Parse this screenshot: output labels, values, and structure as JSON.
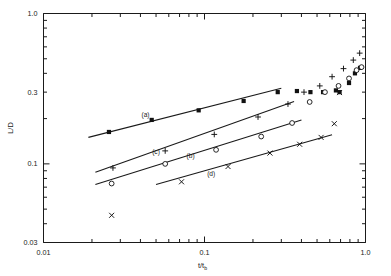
{
  "chart_data": {
    "type": "scatter",
    "title": "",
    "xlabel": "t/t_b",
    "ylabel": "L/D",
    "xscale": "log",
    "yscale": "log",
    "xlim": [
      0.01,
      1.0
    ],
    "ylim": [
      0.03,
      1.0
    ],
    "grid": false,
    "legend": "none",
    "xtick_labels": [
      "0.01",
      "0.1",
      "1.0"
    ],
    "xtick_values": [
      0.01,
      0.1,
      1.0
    ],
    "ytick_labels": [
      "0.03",
      "0.1",
      "0.3",
      "1.0"
    ],
    "ytick_values": [
      0.03,
      0.1,
      0.3,
      1.0
    ],
    "annotations": [
      {
        "text": "(a)",
        "x": 0.043,
        "y": 0.206
      },
      {
        "text": "(b)",
        "x": 0.082,
        "y": 0.11
      },
      {
        "text": "(c)",
        "x": 0.05,
        "y": 0.117
      },
      {
        "text": "(d)",
        "x": 0.11,
        "y": 0.083
      }
    ],
    "series": [
      {
        "name": "(a)",
        "marker": "filled-square",
        "fit_line": {
          "x": [
            0.019,
            0.3
          ],
          "y": [
            0.15,
            0.318
          ]
        },
        "points": [
          {
            "x": 0.0255,
            "y": 0.163
          },
          {
            "x": 0.047,
            "y": 0.196
          },
          {
            "x": 0.092,
            "y": 0.227
          },
          {
            "x": 0.175,
            "y": 0.262
          },
          {
            "x": 0.285,
            "y": 0.3
          },
          {
            "x": 0.375,
            "y": 0.305
          },
          {
            "x": 0.455,
            "y": 0.3
          },
          {
            "x": 0.545,
            "y": 0.3
          },
          {
            "x": 0.655,
            "y": 0.308
          },
          {
            "x": 0.69,
            "y": 0.3
          },
          {
            "x": 0.79,
            "y": 0.345
          },
          {
            "x": 0.86,
            "y": 0.4
          },
          {
            "x": 0.925,
            "y": 0.435
          }
        ]
      },
      {
        "name": "(c)",
        "marker": "plus",
        "fit_line": {
          "x": [
            0.021,
            0.36
          ],
          "y": [
            0.088,
            0.26
          ]
        },
        "points": [
          {
            "x": 0.027,
            "y": 0.094
          },
          {
            "x": 0.057,
            "y": 0.122
          },
          {
            "x": 0.115,
            "y": 0.157
          },
          {
            "x": 0.215,
            "y": 0.205
          },
          {
            "x": 0.33,
            "y": 0.25
          },
          {
            "x": 0.415,
            "y": 0.3
          },
          {
            "x": 0.52,
            "y": 0.33
          },
          {
            "x": 0.62,
            "y": 0.38
          },
          {
            "x": 0.73,
            "y": 0.43
          },
          {
            "x": 0.84,
            "y": 0.49
          },
          {
            "x": 0.92,
            "y": 0.545
          }
        ]
      },
      {
        "name": "(b)",
        "marker": "open-circle",
        "fit_line": {
          "x": [
            0.021,
            0.4
          ],
          "y": [
            0.073,
            0.196
          ]
        },
        "points": [
          {
            "x": 0.0265,
            "y": 0.074
          },
          {
            "x": 0.057,
            "y": 0.1
          },
          {
            "x": 0.118,
            "y": 0.124
          },
          {
            "x": 0.225,
            "y": 0.152
          },
          {
            "x": 0.35,
            "y": 0.187
          },
          {
            "x": 0.45,
            "y": 0.258
          },
          {
            "x": 0.56,
            "y": 0.3
          },
          {
            "x": 0.68,
            "y": 0.33
          },
          {
            "x": 0.79,
            "y": 0.37
          },
          {
            "x": 0.88,
            "y": 0.42
          },
          {
            "x": 0.945,
            "y": 0.44
          }
        ]
      },
      {
        "name": "(d)",
        "marker": "cross",
        "fit_line": {
          "x": [
            0.05,
            0.62
          ],
          "y": [
            0.073,
            0.156
          ]
        },
        "points": [
          {
            "x": 0.0265,
            "y": 0.0455
          },
          {
            "x": 0.072,
            "y": 0.076
          },
          {
            "x": 0.14,
            "y": 0.096
          },
          {
            "x": 0.255,
            "y": 0.118
          },
          {
            "x": 0.39,
            "y": 0.135
          },
          {
            "x": 0.53,
            "y": 0.15
          },
          {
            "x": 0.64,
            "y": 0.185
          },
          {
            "x": 0.69,
            "y": 0.298
          }
        ]
      }
    ]
  }
}
